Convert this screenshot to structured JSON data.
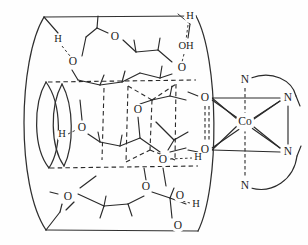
{
  "figure": {
    "name": "cyclodextrin-cobalt-complex-diagram",
    "style": {
      "background_color": "#fefefe",
      "line_color": "#2a2a2a",
      "label_color": "#1c1c1c"
    }
  },
  "metal_center": {
    "symbol": "Co",
    "x": 245,
    "y": 122
  },
  "nitrogen_ligands": [
    {
      "symbol": "N",
      "x": 245,
      "y": 80
    },
    {
      "symbol": "N",
      "x": 288,
      "y": 98
    },
    {
      "symbol": "N",
      "x": 288,
      "y": 152
    },
    {
      "symbol": "N",
      "x": 245,
      "y": 186
    }
  ],
  "oxygen_ligands": [
    {
      "symbol": "O",
      "x": 205,
      "y": 98
    },
    {
      "symbol": "O",
      "x": 205,
      "y": 150
    }
  ],
  "macrocycle_atoms": [
    {
      "symbol": "H",
      "x": 58,
      "y": 40
    },
    {
      "symbol": "O",
      "x": 73,
      "y": 62
    },
    {
      "symbol": "O",
      "x": 115,
      "y": 37
    },
    {
      "symbol": "H",
      "x": 190,
      "y": 17
    },
    {
      "symbol": "OH",
      "x": 186,
      "y": 47
    },
    {
      "symbol": "O",
      "x": 182,
      "y": 68
    },
    {
      "symbol": "O",
      "x": 138,
      "y": 110
    },
    {
      "symbol": "H",
      "x": 62,
      "y": 135
    },
    {
      "symbol": "O",
      "x": 82,
      "y": 128
    },
    {
      "symbol": "O",
      "x": 163,
      "y": 160
    },
    {
      "symbol": "H",
      "x": 198,
      "y": 158
    },
    {
      "symbol": "O",
      "x": 68,
      "y": 197
    },
    {
      "symbol": "O",
      "x": 146,
      "y": 187
    },
    {
      "symbol": "O",
      "x": 180,
      "y": 196
    },
    {
      "symbol": "H",
      "x": 196,
      "y": 205
    },
    {
      "symbol": "O",
      "x": 178,
      "y": 226
    }
  ]
}
